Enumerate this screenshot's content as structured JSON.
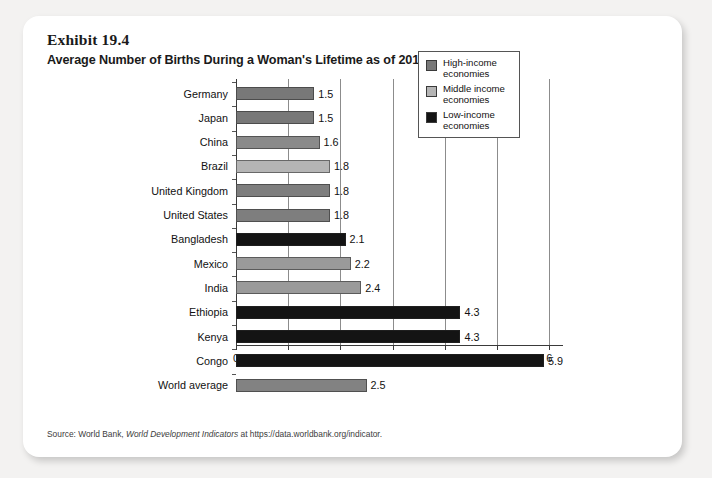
{
  "exhibit": {
    "number": "Exhibit 19.4",
    "title": "Average Number of Births During a Woman's Lifetime as of 2016"
  },
  "source": {
    "prefix": "Source: World Bank, ",
    "italic": "World Development Indicators",
    "suffix": " at https://data.worldbank.org/indicator."
  },
  "legend": {
    "items": [
      {
        "label": "High-income economies",
        "line1": "High-income",
        "line2": "economies",
        "color": "#787878"
      },
      {
        "label": "Middle income economies",
        "line1": "Middle income",
        "line2": "economies",
        "color": "#b5b5b5"
      },
      {
        "label": "Low-income economies",
        "line1": "Low-income",
        "line2": "economies",
        "color": "#141414"
      }
    ]
  },
  "chart_data": {
    "type": "bar",
    "orientation": "horizontal",
    "title": "Average Number of Births During a Woman's Lifetime as of 2016",
    "xlabel": "",
    "ylabel": "",
    "xlim": [
      0,
      6
    ],
    "xticks": [
      "0",
      "1",
      "2",
      "3",
      "4",
      "5",
      "6"
    ],
    "grid": "vertical",
    "legend_position": "upper-right-inside",
    "categories": [
      "Germany",
      "Japan",
      "China",
      "Brazil",
      "United Kingdom",
      "United States",
      "Bangladesh",
      "Mexico",
      "India",
      "Ethiopia",
      "Kenya",
      "Congo",
      "World average"
    ],
    "values": [
      1.5,
      1.5,
      1.6,
      1.8,
      1.8,
      1.8,
      2.1,
      2.2,
      2.4,
      4.3,
      4.3,
      5.9,
      2.5
    ],
    "value_labels": [
      "1.5",
      "1.5",
      "1.6",
      "1.8",
      "1.8",
      "1.8",
      "2.1",
      "2.2",
      "2.4",
      "4.3",
      "4.3",
      "5.9",
      "2.5"
    ],
    "groups": [
      "High-income economies",
      "High-income economies",
      "High-income economies",
      "Middle income economies",
      "High-income economies",
      "High-income economies",
      "Low-income economies",
      "Middle income economies",
      "Middle income economies",
      "Low-income economies",
      "Low-income economies",
      "Low-income economies",
      "World average"
    ],
    "colors": [
      "#787878",
      "#787878",
      "#8a8a8a",
      "#b5b5b5",
      "#7e7e7e",
      "#7e7e7e",
      "#141414",
      "#9a9a9a",
      "#9a9a9a",
      "#141414",
      "#141414",
      "#141414",
      "#828282"
    ]
  }
}
